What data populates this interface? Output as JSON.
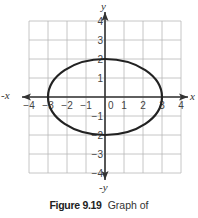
{
  "chart_data": {
    "type": "line",
    "title": "",
    "xlabel": "x",
    "ylabel": "y",
    "x_negative_label": "-x",
    "y_negative_label": "-y",
    "xlim": [
      -4,
      4
    ],
    "ylim": [
      -4,
      4
    ],
    "grid": true,
    "x_ticks": [
      "-4",
      "-3",
      "-2",
      "-1",
      "0",
      "1",
      "2",
      "3",
      "4"
    ],
    "y_ticks": [
      "4",
      "3",
      "2",
      "1",
      "-1",
      "-2",
      "-3",
      "-4"
    ],
    "series": [
      {
        "name": "ellipse",
        "equation": "x^2/9 + y^2/4 = 1",
        "center": [
          0,
          0
        ],
        "semi_axis_x": 3,
        "semi_axis_y": 2,
        "points": [
          [
            3,
            0
          ],
          [
            0,
            2
          ],
          [
            -3,
            0
          ],
          [
            0,
            -2
          ]
        ]
      }
    ]
  },
  "caption": {
    "figure_label": "Figure 9.19",
    "text": "Graph of"
  },
  "colors": {
    "grid": "#b8b8b8",
    "axis": "#333333",
    "curve": "#222222"
  }
}
